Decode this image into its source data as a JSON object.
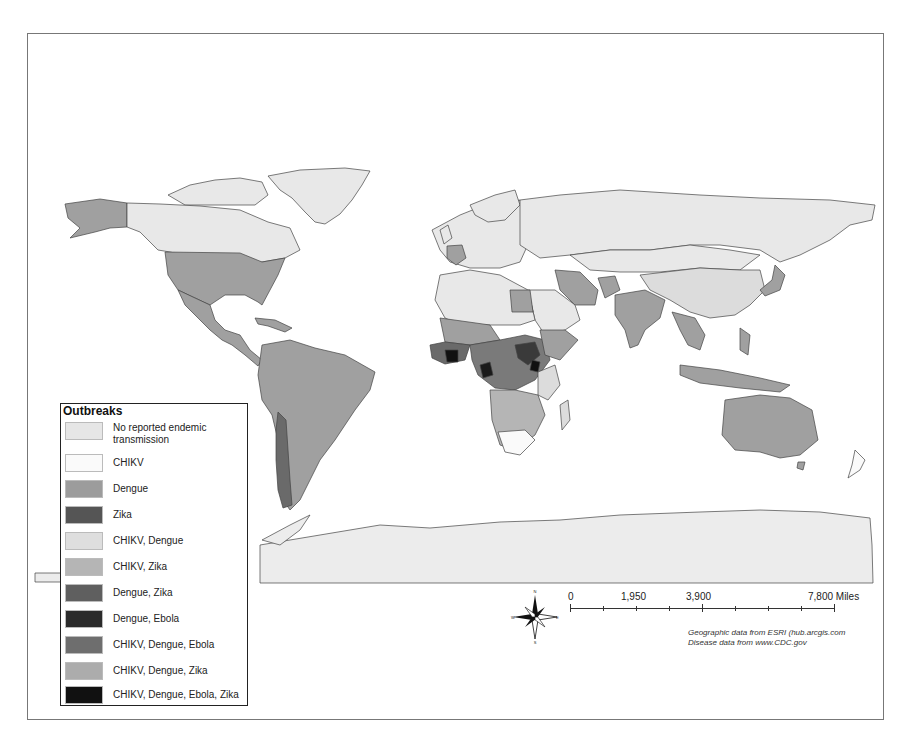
{
  "map": {
    "type": "choropleth world map",
    "background_color": "#ffffff",
    "colors": {
      "no_reported": "#e8e8e8",
      "chikv": "#fafafa",
      "dengue": "#a0a0a0",
      "zika": "#5a5a5a",
      "chikv_dengue": "#dcdcdc",
      "chikv_zika": "#b8b8b8",
      "dengue_zika": "#6c6c6c",
      "dengue_ebola": "#2e2e2e",
      "chikv_dengue_ebola": "#7c7c7c",
      "chikv_dengue_zika": "#b0b0b0",
      "chikv_dengue_ebola_zika": "#111111"
    }
  },
  "legend": {
    "title": "Outbreaks",
    "items": [
      {
        "label_line1": "No reported  endemic",
        "label_line2": "transmission",
        "color": "#e6e6e6"
      },
      {
        "label": "CHIKV",
        "color": "#fafafa"
      },
      {
        "label": "Dengue",
        "color": "#9c9c9c"
      },
      {
        "label": "Zika",
        "color": "#555555"
      },
      {
        "label": "CHIKV, Dengue",
        "color": "#dedede"
      },
      {
        "label": "CHIKV, Zika",
        "color": "#b5b5b5"
      },
      {
        "label": "Dengue, Zika",
        "color": "#5f5f5f"
      },
      {
        "label": "Dengue, Ebola",
        "color": "#2b2b2b"
      },
      {
        "label": "CHIKV, Dengue, Ebola",
        "color": "#6e6e6e"
      },
      {
        "label": "CHIKV, Dengue, Zika",
        "color": "#acacac"
      },
      {
        "label": "CHIKV, Dengue, Ebola, Zika",
        "color": "#111111"
      }
    ]
  },
  "scale_bar": {
    "labels": [
      "0",
      "1,950",
      "3,900",
      "7,800 Miles"
    ],
    "ticks": 9
  },
  "compass": {
    "n": "N",
    "s": "S",
    "e": "E",
    "w": "W"
  },
  "attribution": {
    "line1": "Geographic data from ESRI (hub.arcgis.com",
    "line2": "Disease data from www.CDC.gov"
  }
}
